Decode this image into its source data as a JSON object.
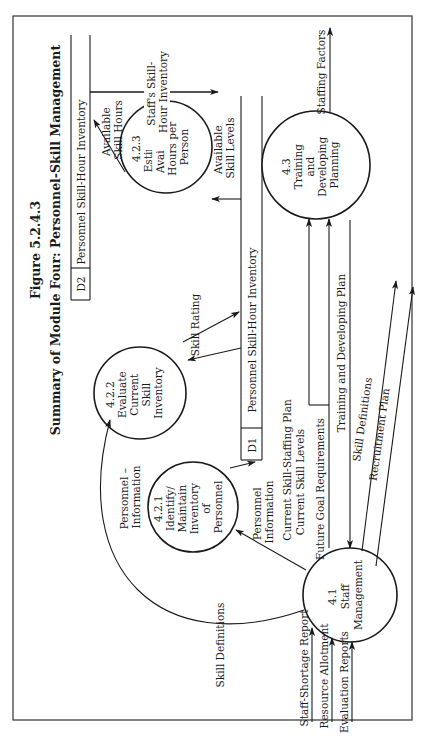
{
  "figure": {
    "number": "Figure 5.2.4.3",
    "title": "Summary of Module Four: Personnel-Skill Management",
    "orientation": "rotated 90 degrees counter-clockwise"
  },
  "data_stores": [
    {
      "id": "D2",
      "label": "Personnel Skill-Hour Inventory"
    },
    {
      "id": "D1",
      "label": "Personnel Skill-Hour Inventory"
    }
  ],
  "processes": [
    {
      "id": "4.1",
      "lines": [
        "4.1",
        "Staff",
        "Management"
      ]
    },
    {
      "id": "4.2.1",
      "lines": [
        "4.2.1",
        "Identify/",
        "Maintain",
        "Inventory",
        "of",
        "Personnel"
      ]
    },
    {
      "id": "4.2.2",
      "lines": [
        "4.2.2",
        "Evaluate",
        "Current",
        "Skill",
        "Inventory"
      ]
    },
    {
      "id": "4.2.3",
      "lines": [
        "4.2.3",
        "Estimate",
        "Available",
        "Hours per",
        "Person"
      ]
    },
    {
      "id": "4.3",
      "lines": [
        "4.3",
        "Training",
        "and",
        "Developing",
        "Planning"
      ]
    }
  ],
  "flows": {
    "available_skill_hours": [
      "Available",
      "Skill Hours"
    ],
    "staffs_skill_hour_inventory": [
      "Staff's Skill-",
      "Hour Inventory"
    ],
    "available_skill_levels": [
      "Available",
      "Skill Levels"
    ],
    "skill_rating": "Skill Rating",
    "personnel_information_to_d1": [
      "Personnel",
      "Information"
    ],
    "personnel_information_curve": [
      "Personnel –",
      "Information"
    ],
    "skill_definitions_curve": "Skill Definitions",
    "current_skill_staffing_plan": "Current Skill-Staffing Plan",
    "current_skill_levels": "Current Skill Levels",
    "future_goal_requirements": "Future  Goal Requirements",
    "training_and_developing_plan": "Training and Developing Plan",
    "skill_definitions_out": "Skill Definitions",
    "recruitment_plan": "Recruitment Plan",
    "staffing_factors": "Staffing Factors",
    "staff_shortage_report": "Staff-Shortage Report",
    "resource_allotment": "Resource Allotment",
    "evaluation_reports": "Evaluation Reports"
  }
}
